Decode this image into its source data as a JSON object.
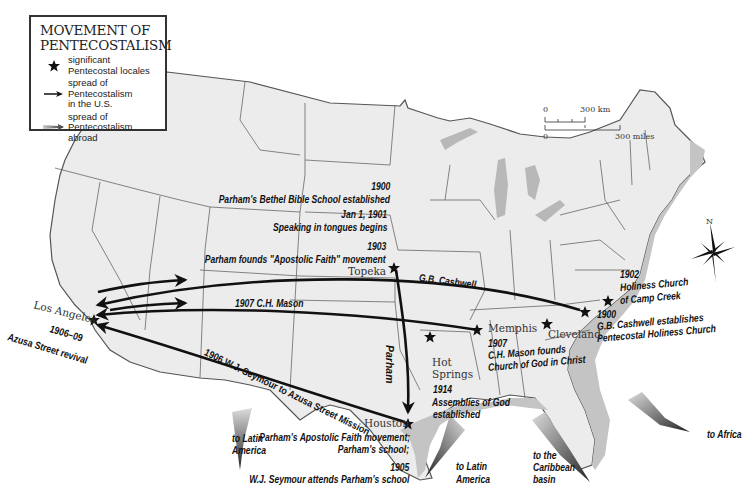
{
  "legend": {
    "title_line1": "MOVEMENT OF",
    "title_line2": "PENTECOSTALISM",
    "items": [
      {
        "icon": "star-icon",
        "line1": "significant",
        "line2": "Pentecostal  locales",
        "line3": ""
      },
      {
        "icon": "arrow-icon",
        "line1": "spread of",
        "line2": "Pentecostalism",
        "line3": "in the U.S."
      },
      {
        "icon": "gradient-arrow-icon",
        "line1": "spread of",
        "line2": "Pentecostalism",
        "line3": "abroad"
      }
    ]
  },
  "scale": {
    "km_zero": "0",
    "km_label": "300 km",
    "mi_zero": "0",
    "mi_label": "300 miles"
  },
  "compass": {
    "north_label": "N"
  },
  "cities": {
    "los_angeles": "Los Angeles",
    "topeka": "Topeka",
    "memphis": "Memphis",
    "cleveland": "Cleveland",
    "hot_springs_1": "Hot",
    "hot_springs_2": "Springs",
    "houston": "Houston"
  },
  "events": {
    "bethel_year": "1900",
    "bethel_text": "Parham's Bethel Bible School established",
    "tongues_year": "Jan 1, 1901",
    "tongues_text": "Speaking in tongues begins",
    "apostolic_year": "1903",
    "apostolic_text": "Parham founds \"Apostolic Faith\" movement",
    "azusa_years": "1906–09",
    "azusa_text": "Azusa Street revival",
    "cashwell_route": "G.B. Cashwell",
    "mason_route": "1907  C.H. Mason",
    "seymour_route": "1906  W.J. Seymour to Azusa Street Mission",
    "parham_route": "Parham",
    "camp_creek_year": "1902",
    "camp_creek_line1": "Holiness Church",
    "camp_creek_line2": "of Camp Creek",
    "cashwell_year": "1900",
    "cashwell_line1": "G.B. Cashwell establishes",
    "cashwell_line2": "Pentecostal Holiness Church",
    "mason_year": "1907",
    "mason_line1": "C.H. Mason founds",
    "mason_line2": "Church of God in Christ",
    "aog_year": "1914",
    "aog_line1": "Assemblies of God",
    "aog_line2": "established",
    "houston_line1": "Parham's Apostolic Faith movement;",
    "houston_line2": "Parham's school;",
    "houston_year": "1905",
    "houston_line3": "W.J. Seymour attends Parham's school"
  },
  "abroad": {
    "latin_america_west_1": "to Latin",
    "latin_america_west_2": "America",
    "latin_america_gulf_1": "to Latin",
    "latin_america_gulf_2": "America",
    "caribbean_1": "to the",
    "caribbean_2": "Caribbean",
    "caribbean_3": "basin",
    "africa": "to Africa"
  },
  "colors": {
    "land": "#ececec",
    "water_shade": "#b8b8b8",
    "border": "#444444",
    "arrow": "#111111"
  }
}
